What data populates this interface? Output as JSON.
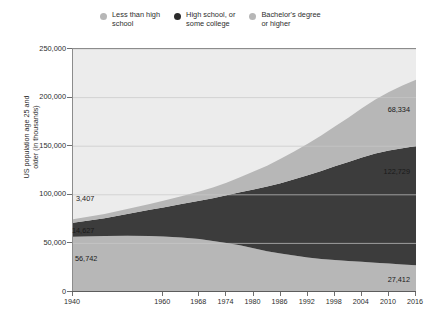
{
  "chart_data": {
    "type": "area",
    "stacked": true,
    "title": "",
    "subtitle": "",
    "xlabel": "",
    "ylabel": "US population age 25 and\nolder (in thousands)",
    "xlim": [
      1940,
      2016
    ],
    "ylim": [
      0,
      250000
    ],
    "grid": true,
    "legend_position": "top",
    "ytick_labels": [
      "250,000",
      "200,000",
      "150,000",
      "100,000",
      "50,000",
      "0"
    ],
    "ytick_values": [
      250000,
      200000,
      150000,
      100000,
      50000,
      0
    ],
    "xtick_labels": [
      "1940",
      "1960",
      "1968",
      "1974",
      "1980",
      "1986",
      "1992",
      "1998",
      "2004",
      "2010",
      "2016"
    ],
    "xtick_values": [
      1940,
      1960,
      1968,
      1974,
      1980,
      1986,
      1992,
      1998,
      2004,
      2010,
      2016
    ],
    "x": [
      1940,
      1947,
      1952,
      1957,
      1960,
      1964,
      1968,
      1971,
      1974,
      1977,
      1980,
      1983,
      1986,
      1989,
      1992,
      1995,
      1998,
      2001,
      2004,
      2007,
      2010,
      2013,
      2016
    ],
    "series": [
      {
        "name": "Less than high school",
        "color": "#b7b7b7",
        "stack_order": 1,
        "values": [
          56742,
          57500,
          57800,
          57500,
          57000,
          56000,
          54500,
          52500,
          50500,
          48000,
          45000,
          42000,
          39500,
          37500,
          35500,
          34000,
          32800,
          31800,
          31000,
          30000,
          29200,
          28200,
          27412
        ]
      },
      {
        "name": "High school, or some college",
        "color": "#3c3c3c",
        "stack_order": 2,
        "values": [
          14627,
          18500,
          22500,
          27000,
          30000,
          34500,
          39500,
          44000,
          49000,
          54500,
          60500,
          66500,
          72500,
          78500,
          84500,
          90500,
          96500,
          102000,
          107500,
          112500,
          116500,
          119800,
          122729
        ]
      },
      {
        "name": "Bachelor's degree or higher",
        "color": "#b7b7b7",
        "stack_order": 3,
        "values": [
          3407,
          4200,
          5000,
          6000,
          6800,
          8000,
          9500,
          11000,
          13000,
          15500,
          18500,
          21500,
          25000,
          28500,
          32500,
          36500,
          41000,
          45500,
          50500,
          55500,
          60000,
          64500,
          68334
        ]
      }
    ],
    "annotations": [
      {
        "name": "bachelors-start",
        "text": "3,407",
        "series": "Bachelor's degree or higher",
        "x": 1940,
        "value": 3407
      },
      {
        "name": "highschool-start",
        "text": "14,627",
        "series": "High school, or some college",
        "x": 1940,
        "value": 14627
      },
      {
        "name": "lessthanhs-start",
        "text": "56,742",
        "series": "Less than high school",
        "x": 1940,
        "value": 56742
      },
      {
        "name": "bachelors-end",
        "text": "68,334",
        "series": "Bachelor's degree or higher",
        "x": 2016,
        "value": 68334
      },
      {
        "name": "highschool-end",
        "text": "122,729",
        "series": "High school, or some college",
        "x": 2016,
        "value": 122729
      },
      {
        "name": "lessthanhs-end",
        "text": "27,412",
        "series": "Less than high school",
        "x": 2016,
        "value": 27412
      }
    ]
  },
  "legend": {
    "items": [
      {
        "label": "Less than high\nschool",
        "color": "#b7b7b7"
      },
      {
        "label": "High school, or\nsome college",
        "color": "#2b2b2b"
      },
      {
        "label": "Bachelor's degree\nor higher",
        "color": "#b7b7b7"
      }
    ]
  },
  "axes": {
    "y_title": "US population age 25 and\nolder (in thousands)",
    "y_ticks": [
      "250,000",
      "200,000",
      "150,000",
      "100,000",
      "50,000",
      "0"
    ],
    "x_ticks": [
      "1940",
      "1960",
      "1968",
      "1974",
      "1980",
      "1986",
      "1992",
      "1998",
      "2004",
      "2010",
      "2016"
    ]
  },
  "annotations": {
    "bachelors_start": "3,407",
    "highschool_start": "14,627",
    "lessthanhs_start": "56,742",
    "bachelors_end": "68,334",
    "highschool_end": "122,729",
    "lessthanhs_end": "27,412"
  },
  "colors": {
    "band_light": "#b7b7b7",
    "band_dark": "#3c3c3c",
    "plot_background": "#ececec",
    "page_background": "#ffffff",
    "axis": "#6f6f6f",
    "gridline": "#c9c9c9",
    "text": "#2d2d2d"
  }
}
